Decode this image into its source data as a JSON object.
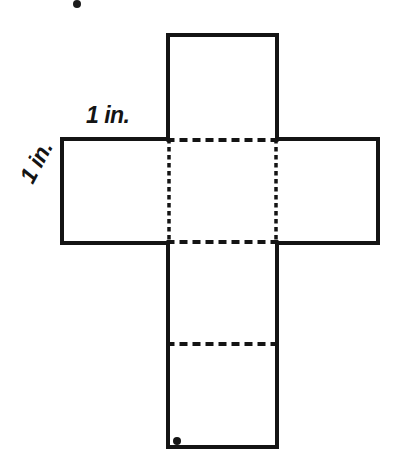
{
  "figure": {
    "background_color": "#ffffff",
    "line_color": "#141414",
    "solid_stroke_width": 4,
    "dashed_stroke_width": 3.5
  },
  "labels": {
    "top_edge": "1 in.",
    "left_edge": "1 in."
  },
  "chart_data": {
    "type": "diagram",
    "units": "in.",
    "edge_length": 1,
    "panels": [
      {
        "name": "top-flap",
        "x": 168,
        "y": 35,
        "width": 109,
        "height": 105
      },
      {
        "name": "left-face",
        "x": 62,
        "y": 139,
        "width": 107,
        "height": 104
      },
      {
        "name": "center-face",
        "x": 168,
        "y": 139,
        "width": 109,
        "height": 104
      },
      {
        "name": "right-face",
        "x": 276,
        "y": 139,
        "width": 102,
        "height": 104
      },
      {
        "name": "bottom-face",
        "x": 168,
        "y": 243,
        "width": 109,
        "height": 101
      },
      {
        "name": "bottom-flap",
        "x": 168,
        "y": 344,
        "width": 109,
        "height": 103
      }
    ],
    "solid_outline_path": "M168,35 L277,35 L277,139 L378,139 L378,243 L277,243 L277,447 L168,447 L168,243 L62,243 L62,139 L168,139 Z",
    "fold_lines": [
      {
        "name": "fold-top-horizontal",
        "orientation": "horizontal",
        "x1": 168,
        "y1": 140,
        "x2": 277,
        "y2": 140
      },
      {
        "name": "fold-bottom-horizontal",
        "orientation": "horizontal",
        "x1": 168,
        "y1": 242,
        "x2": 277,
        "y2": 242
      },
      {
        "name": "fold-left-vertical",
        "orientation": "vertical",
        "x1": 169,
        "y1": 139,
        "x2": 169,
        "y2": 243
      },
      {
        "name": "fold-right-vertical",
        "orientation": "vertical",
        "x1": 276,
        "y1": 139,
        "x2": 276,
        "y2": 243
      },
      {
        "name": "fold-lower-horizontal",
        "orientation": "horizontal",
        "x1": 168,
        "y1": 344,
        "x2": 277,
        "y2": 344
      }
    ],
    "annotations": [
      {
        "name": "top-edge-length",
        "text": "1 in.",
        "x": 86,
        "y": 104,
        "rotation": 0
      },
      {
        "name": "left-edge-length",
        "text": "1 in.",
        "x": 16,
        "y": 176,
        "rotation": -62
      }
    ]
  }
}
